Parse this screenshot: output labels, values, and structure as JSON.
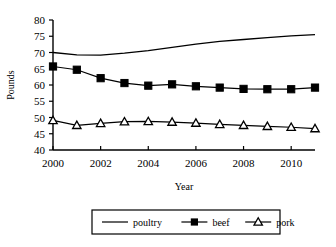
{
  "chart_data": {
    "type": "line",
    "title": "",
    "xlabel": "Year",
    "ylabel": "Pounds",
    "xlim": [
      2000,
      2011
    ],
    "ylim": [
      40,
      80
    ],
    "ytick_step": 5,
    "grid": false,
    "legend_position": "bottom",
    "x": [
      2000,
      2001,
      2002,
      2003,
      2004,
      2005,
      2006,
      2007,
      2008,
      2009,
      2010,
      2011
    ],
    "xtick_labels": [
      "2000",
      "2002",
      "2004",
      "2006",
      "2008",
      "2010"
    ],
    "xtick_values": [
      2000,
      2002,
      2004,
      2006,
      2008,
      2010
    ],
    "ytick_labels": [
      "40",
      "45",
      "50",
      "55",
      "60",
      "65",
      "70",
      "75",
      "80"
    ],
    "ytick_values": [
      40,
      45,
      50,
      55,
      60,
      65,
      70,
      75,
      80
    ],
    "series": [
      {
        "name": "poultry",
        "marker": "none",
        "color": "#000000",
        "values": [
          70.0,
          69.3,
          69.2,
          69.8,
          70.6,
          71.6,
          72.6,
          73.4,
          74.0,
          74.6,
          75.1,
          75.5
        ]
      },
      {
        "name": "beef",
        "marker": "filled-square",
        "color": "#000000",
        "values": [
          65.7,
          64.7,
          62.1,
          60.6,
          59.8,
          60.2,
          59.6,
          59.2,
          58.8,
          58.7,
          58.7,
          59.2
        ]
      },
      {
        "name": "pork",
        "marker": "open-triangle",
        "color": "#000000",
        "values": [
          49.1,
          47.6,
          48.2,
          48.7,
          48.8,
          48.6,
          48.3,
          47.9,
          47.6,
          47.3,
          47.0,
          46.6
        ]
      }
    ]
  },
  "legend": {
    "items": [
      {
        "label": "poultry",
        "marker": "none"
      },
      {
        "label": "beef",
        "marker": "filled-square"
      },
      {
        "label": "pork",
        "marker": "open-triangle"
      }
    ]
  }
}
